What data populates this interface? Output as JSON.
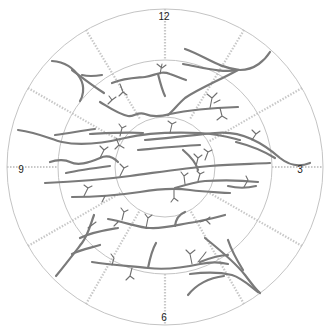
{
  "diagram": {
    "type": "clock-hour fundus chart",
    "center": [
      165,
      167
    ],
    "rings": [
      {
        "name": "outer",
        "radius": 158
      },
      {
        "name": "middle",
        "radius": 107
      },
      {
        "name": "inner",
        "radius": 50
      }
    ],
    "spoke_count": 12,
    "hour_labels": [
      {
        "label": "12",
        "x": 164,
        "y": 17
      },
      {
        "label": "3",
        "x": 300,
        "y": 170
      },
      {
        "label": "6",
        "x": 164,
        "y": 318
      },
      {
        "label": "9",
        "x": 21,
        "y": 170
      }
    ],
    "colors": {
      "ring": "#c4c4c4",
      "spoke": "#c8c8c8",
      "vessel": "#7a7a7a",
      "label": "#222222"
    }
  }
}
